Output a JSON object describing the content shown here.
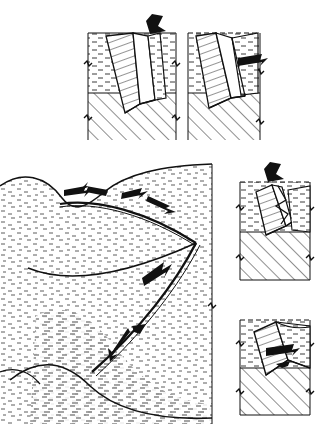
{
  "figure": {
    "domain": "geological-cross-section-diagram",
    "background_color": "#ffffff",
    "ink_color": "#111111",
    "panel_count": 5,
    "units": "none"
  },
  "legend": {
    "upper_unit": {
      "name": "sedimentary-cover-dash-stipple",
      "pattern": "short-horizontal-dashes",
      "color": "#333333"
    },
    "lower_unit": {
      "name": "basement-diagonal-hatch",
      "pattern": "diagonal-lines-45deg",
      "color": "#333333"
    },
    "fault_block": {
      "name": "displaced-thrust-sheet",
      "pattern": "inclined-ruled-lines",
      "color": "#222222"
    },
    "break_symbol": {
      "name": "section-break-mark",
      "description": "zigzag break on panel side boundary"
    }
  },
  "panels": [
    {
      "id": "panel-1",
      "label": "stage-1-initial-thrust-ramp",
      "position": {
        "x": 88,
        "y": 28,
        "w": 88,
        "h": 112
      },
      "arrow": {
        "name": "load-arrow-down",
        "direction": "down",
        "angle_deg": 215
      },
      "description": "Inclined fault block cuts down from surface into hatched basement; cover layer undisturbed"
    },
    {
      "id": "panel-2",
      "label": "stage-2-hangingwall-translation",
      "position": {
        "x": 188,
        "y": 28,
        "w": 72,
        "h": 112
      },
      "arrow": {
        "name": "transport-arrow-left",
        "direction": "left",
        "angle_deg": 180
      },
      "description": "Block rotated and translated left; wedge of cover overthrust onto hatched unit"
    },
    {
      "id": "panel-3",
      "label": "stage-3-imbricate-stack",
      "position": {
        "x": 238,
        "y": 172,
        "w": 72,
        "h": 108
      },
      "arrow": {
        "name": "load-arrow-down",
        "direction": "down",
        "angle_deg": 210
      },
      "description": "Second slice detaches forming imbricate fan above basement"
    },
    {
      "id": "panel-4",
      "label": "stage-4-final-displacement",
      "position": {
        "x": 238,
        "y": 310,
        "w": 72,
        "h": 105
      },
      "arrow": {
        "name": "transport-arrow-left",
        "direction": "left",
        "angle_deg": 180
      },
      "description": "Thrust sheet fully emplaced; hangingwall ramp flattened onto basement"
    },
    {
      "id": "panel-main",
      "label": "main-large-scale-section",
      "position": {
        "x": 0,
        "y": 162,
        "w": 214,
        "h": 262
      },
      "description": "Large-scale stippled section showing curved listric thrust traces converging at a branch point",
      "shear_arrows": [
        {
          "name": "shear-arrow-upper-left",
          "direction": "up-left",
          "x": 78,
          "y": 190
        },
        {
          "name": "shear-arrow-upper-right",
          "direction": "up-left",
          "x": 150,
          "y": 204
        },
        {
          "name": "shear-arrow-mid",
          "direction": "up-left",
          "x": 160,
          "y": 272
        },
        {
          "name": "shear-arrow-lower",
          "direction": "down-right",
          "x": 120,
          "y": 345
        }
      ]
    }
  ],
  "annotations": {
    "arrow_count_total": 8,
    "fault_traces": 4,
    "branch_point": {
      "x": 196,
      "y": 243
    }
  }
}
